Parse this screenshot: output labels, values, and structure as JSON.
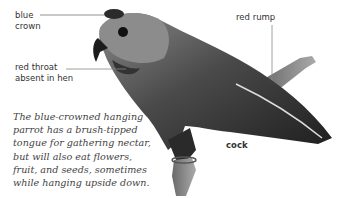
{
  "labels": {
    "blue_crown": [
      "blue",
      "crown"
    ],
    "red_throat": [
      "red throat",
      "absent in hen"
    ],
    "red_rump": "red rump",
    "sex": "cock"
  },
  "caption": [
    "The blue-crowned hanging",
    "parrot has a brush-tipped",
    "tongue for gathering nectar,",
    "but will also eat flowers,",
    "fruit, and seeds, sometimes",
    "while hanging upside down."
  ]
}
